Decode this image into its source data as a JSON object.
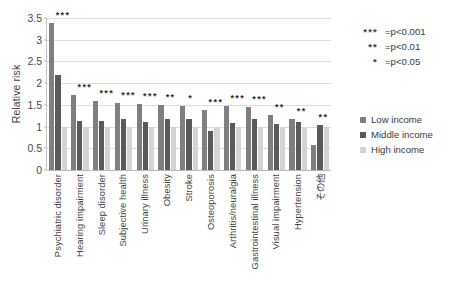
{
  "chart_data": {
    "type": "bar",
    "title": "",
    "xlabel": "",
    "ylabel": "Relative risk",
    "ylim": [
      0,
      3.5
    ],
    "ytick_step": 0.5,
    "yticks": [
      "0",
      "0.5",
      "1",
      "1.5",
      "2",
      "2.5",
      "3",
      "3.5"
    ],
    "grid": true,
    "legend_position": "right",
    "categories": [
      "Psychiatric disorder",
      "Hearing impairment",
      "Sleep disorder",
      "Subjective health",
      "Urinary illness",
      "Obesity",
      "Stroke",
      "Osteoporosis",
      "Arthritis/neuralgia",
      "Gastrointestinal illness",
      "Visual impairment",
      "Hypertension",
      "その他"
    ],
    "series": [
      {
        "name": "Low income",
        "color": "#7f7f7f",
        "values": [
          3.38,
          1.72,
          1.58,
          1.55,
          1.52,
          1.49,
          1.47,
          1.39,
          1.47,
          1.45,
          1.27,
          1.18,
          0.58
        ]
      },
      {
        "name": "Middle income",
        "color": "#5a5a5a",
        "values": [
          2.18,
          1.14,
          1.13,
          1.18,
          1.11,
          1.17,
          1.18,
          0.89,
          1.08,
          1.18,
          1.05,
          1.1,
          1.03
        ]
      },
      {
        "name": "High income",
        "color": "#d4d4d4",
        "values": [
          1.0,
          1.0,
          1.0,
          1.0,
          1.0,
          1.0,
          1.0,
          1.0,
          1.0,
          1.0,
          1.0,
          1.0,
          1.0
        ]
      }
    ],
    "significance": [
      "***",
      "***",
      "***",
      "***",
      "***",
      "**",
      "*",
      "***",
      "***",
      "***",
      "**",
      "**",
      "**"
    ]
  },
  "legend": {
    "items": [
      {
        "label": "Low income"
      },
      {
        "label": "Middle income"
      },
      {
        "label": "High income"
      }
    ]
  },
  "significance_key": {
    "rows": [
      {
        "stars": "***",
        "text": "=p<0.001"
      },
      {
        "stars": "**",
        "text": "=p<0.01"
      },
      {
        "stars": "*",
        "text": "=p<0.05"
      }
    ]
  }
}
